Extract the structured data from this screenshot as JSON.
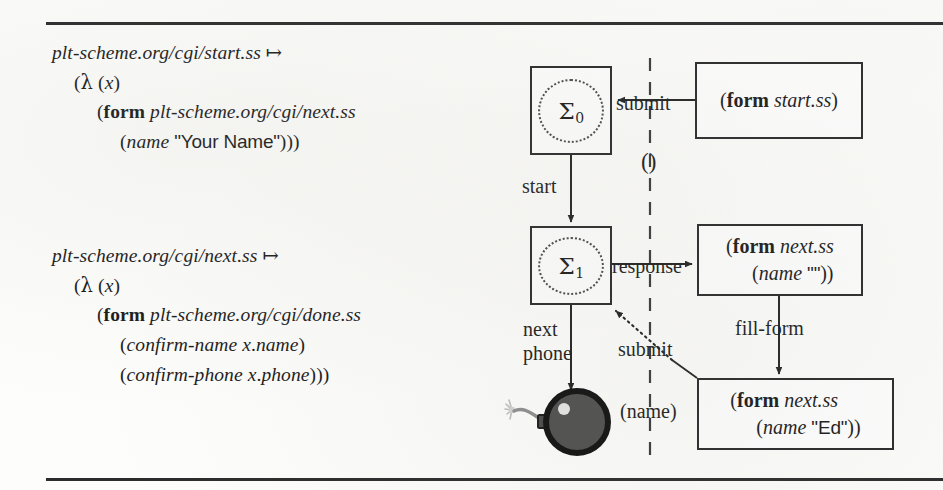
{
  "figure": {
    "kind": "web-program state transition diagram",
    "top_rule": true,
    "bottom_rule": true
  },
  "code_blocks": [
    {
      "id": "start-ss-definition",
      "lines": [
        {
          "indent": 0,
          "parts": [
            {
              "t": "plt-scheme.org/cgi/start.ss ",
              "s": "italic"
            },
            {
              "t": "↦",
              "s": "roman"
            }
          ]
        },
        {
          "indent": 1,
          "parts": [
            {
              "t": "(",
              "s": "roman"
            },
            {
              "t": "λ",
              "s": "lam"
            },
            {
              "t": " (",
              "s": "roman"
            },
            {
              "t": "x",
              "s": "italic"
            },
            {
              "t": ")",
              "s": "roman"
            }
          ]
        },
        {
          "indent": 2,
          "parts": [
            {
              "t": "(",
              "s": "roman"
            },
            {
              "t": "form",
              "s": "bold"
            },
            {
              "t": " plt-scheme.org/cgi/next.ss",
              "s": "italic"
            }
          ]
        },
        {
          "indent": 3,
          "parts": [
            {
              "t": "(",
              "s": "roman"
            },
            {
              "t": "name",
              "s": "italic"
            },
            {
              "t": " ",
              "s": "roman"
            },
            {
              "t": "\"Your Name\"",
              "s": "strlit"
            },
            {
              "t": ")))",
              "s": "roman"
            }
          ]
        }
      ]
    },
    {
      "id": "next-ss-definition",
      "lines": [
        {
          "indent": 0,
          "parts": [
            {
              "t": "plt-scheme.org/cgi/next.ss ",
              "s": "italic"
            },
            {
              "t": "↦",
              "s": "roman"
            }
          ]
        },
        {
          "indent": 1,
          "parts": [
            {
              "t": "(",
              "s": "roman"
            },
            {
              "t": "λ",
              "s": "lam"
            },
            {
              "t": " (",
              "s": "roman"
            },
            {
              "t": "x",
              "s": "italic"
            },
            {
              "t": ")",
              "s": "roman"
            }
          ]
        },
        {
          "indent": 2,
          "parts": [
            {
              "t": "(",
              "s": "roman"
            },
            {
              "t": "form",
              "s": "bold"
            },
            {
              "t": " plt-scheme.org/cgi/done.ss",
              "s": "italic"
            }
          ]
        },
        {
          "indent": 3,
          "parts": [
            {
              "t": "(",
              "s": "roman"
            },
            {
              "t": "confirm-name x",
              "s": "italic"
            },
            {
              "t": ".",
              "s": "roman"
            },
            {
              "t": "name",
              "s": "italic"
            },
            {
              "t": ")",
              "s": "roman"
            }
          ]
        },
        {
          "indent": 3,
          "parts": [
            {
              "t": "(",
              "s": "roman"
            },
            {
              "t": "confirm-phone x",
              "s": "italic"
            },
            {
              "t": ".",
              "s": "roman"
            },
            {
              "t": "phone",
              "s": "italic"
            },
            {
              "t": ")))",
              "s": "roman"
            }
          ]
        }
      ]
    }
  ],
  "diagram": {
    "divider": {
      "name": "client-server-divider",
      "style": "dashed-vertical"
    },
    "states": [
      {
        "id": "sigma0",
        "label": "Σ",
        "subscript": "0"
      },
      {
        "id": "sigma1",
        "label": "Σ",
        "subscript": "1"
      }
    ],
    "forms": [
      {
        "id": "form-start",
        "line1": "(form start.ss)",
        "line2": ""
      },
      {
        "id": "form-next-empty",
        "line1": "(form next.ss",
        "line2": "(name \"\"))"
      },
      {
        "id": "form-next-ed",
        "line1": "(form next.ss",
        "line2": "(name \"Ed\"))"
      }
    ],
    "edges": [
      {
        "id": "submit-top",
        "label": "submit",
        "style": "solid"
      },
      {
        "id": "empty-args",
        "label": "()",
        "style": "annotation"
      },
      {
        "id": "start",
        "label": "start",
        "style": "solid"
      },
      {
        "id": "response",
        "label": "response",
        "style": "solid"
      },
      {
        "id": "fill-form",
        "label": "fill-form",
        "style": "solid"
      },
      {
        "id": "submit-bottom",
        "label": "submit",
        "style": "dotted"
      },
      {
        "id": "name-args",
        "label": "(name)",
        "style": "annotation"
      },
      {
        "id": "next-phone",
        "label": "next\nphone",
        "style": "solid"
      }
    ],
    "bomb": {
      "id": "error-bomb",
      "description": "bomb icon denoting failure"
    }
  },
  "form_text": {
    "form_start_l1_open": "(",
    "form_start_keyword": "form",
    "form_start_arg": " start.ss)",
    "form_next_keyword": "form",
    "form_next_arg": " next.ss",
    "form_next_name_empty": "(name \"\"))",
    "form_next_name_ed_pre": "(name ",
    "form_next_name_ed_str": "\"Ed\"",
    "form_next_name_ed_post": "))"
  }
}
